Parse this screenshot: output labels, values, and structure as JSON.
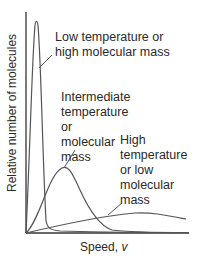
{
  "chart_data": {
    "type": "line",
    "title": "",
    "xlabel": "Speed, v",
    "ylabel": "Relative number of molecules",
    "grid": false,
    "legend": "none (curves labeled directly with annotations)",
    "xticks": [],
    "yticks": [],
    "series": [
      {
        "name": "Low temperature or high molecular mass",
        "description": "Tall narrow peak near origin",
        "x": [
          0,
          2,
          4,
          6,
          8,
          10,
          12,
          14,
          16,
          20,
          25,
          30,
          40,
          60,
          100,
          160
        ],
        "y": [
          0,
          40,
          110,
          190,
          212,
          190,
          120,
          50,
          18,
          6,
          3,
          2,
          1.5,
          1,
          0.5,
          0.2
        ]
      },
      {
        "name": "Intermediate temperature or molecular mass",
        "description": "Medium-height peak at moderate speed",
        "x": [
          0,
          10,
          20,
          30,
          38,
          45,
          55,
          65,
          75,
          85,
          95,
          120,
          160
        ],
        "y": [
          0,
          12,
          35,
          58,
          66,
          62,
          44,
          22,
          8,
          3,
          1,
          0.3,
          0
        ]
      },
      {
        "name": "High temperature or low molecular mass",
        "description": "Low, broad distribution extending to high speeds",
        "x": [
          0,
          20,
          40,
          60,
          80,
          100,
          115,
          130,
          145,
          160
        ],
        "y": [
          0,
          5,
          10,
          14,
          18,
          20,
          21,
          19,
          16,
          13
        ]
      }
    ],
    "annotations": [
      "Low temperature or\nhigh molecular mass",
      "Intermediate\ntemperature\nor\nmolecular\nmass",
      "High\ntemperature\nor low\nmolecular\nmass"
    ]
  },
  "labels": {
    "low": "Low temperature or\nhigh molecular mass",
    "intermediate": "Intermediate\ntemperature\nor\nmolecular\nmass",
    "high": "High\ntemperature\nor low\nmolecular\nmass",
    "xaxis": "Speed, v",
    "yaxis": "Relative number of molecules"
  },
  "colors": {
    "curve": "#555555",
    "axis": "#333333",
    "text": "#2a2a2a"
  }
}
